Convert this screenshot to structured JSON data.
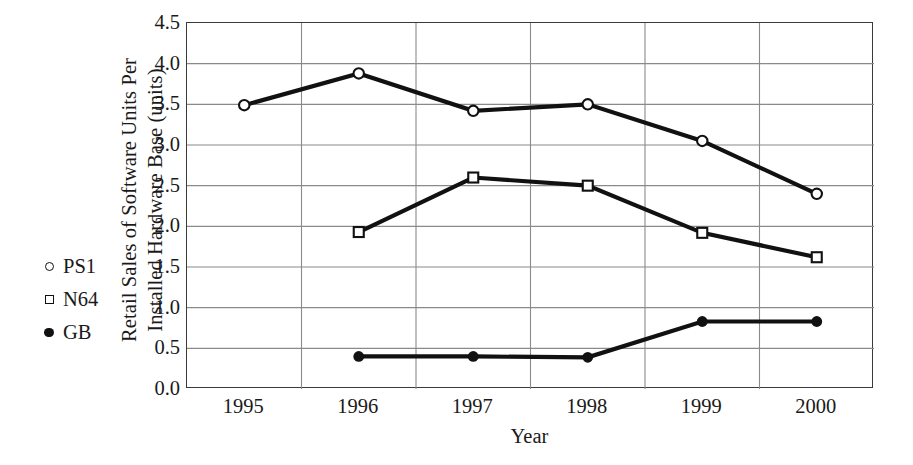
{
  "chart_data": {
    "type": "line",
    "title": "",
    "xlabel": "Year",
    "ylabel": "Retail Sales of Software Units Per Installed Hardware Base (units)",
    "ylabel_lines": [
      "Retail Sales of Software Units Per",
      "Installed Hardware Base (units)"
    ],
    "categories": [
      "1995",
      "1996",
      "1997",
      "1998",
      "1999",
      "2000"
    ],
    "ylim": [
      0.0,
      4.5
    ],
    "ytick_labels": [
      "0.0",
      "0.5",
      "1.0",
      "1.5",
      "2.0",
      "2.5",
      "3.0",
      "3.5",
      "4.0",
      "4.5"
    ],
    "ytick_values": [
      0.0,
      0.5,
      1.0,
      1.5,
      2.0,
      2.5,
      3.0,
      3.5,
      4.0,
      4.5
    ],
    "grid": true,
    "grid_axis": "both",
    "legend_position": "inside-left",
    "series": [
      {
        "name": "PS1",
        "marker": "open-circle",
        "color": "#111111",
        "x": [
          "1995",
          "1996",
          "1997",
          "1998",
          "1999",
          "2000"
        ],
        "values": [
          3.49,
          3.88,
          3.42,
          3.5,
          3.05,
          2.4
        ]
      },
      {
        "name": "N64",
        "marker": "open-square",
        "color": "#111111",
        "x": [
          "1996",
          "1997",
          "1998",
          "1999",
          "2000"
        ],
        "values": [
          1.93,
          2.6,
          2.5,
          1.92,
          1.62
        ]
      },
      {
        "name": "GB",
        "marker": "filled-circle",
        "color": "#111111",
        "x": [
          "1996",
          "1997",
          "1998",
          "1999",
          "2000"
        ],
        "values": [
          0.4,
          0.4,
          0.39,
          0.83,
          0.83
        ]
      }
    ]
  },
  "legend": {
    "items": [
      {
        "label": "PS1",
        "marker": "open-circle"
      },
      {
        "label": "N64",
        "marker": "open-square"
      },
      {
        "label": "GB",
        "marker": "filled-circle"
      }
    ]
  },
  "colors": {
    "line": "#111111",
    "axis": "#3a3a3a",
    "grid": "#8a8a8a",
    "text": "#1a1a1a",
    "background": "#ffffff"
  }
}
